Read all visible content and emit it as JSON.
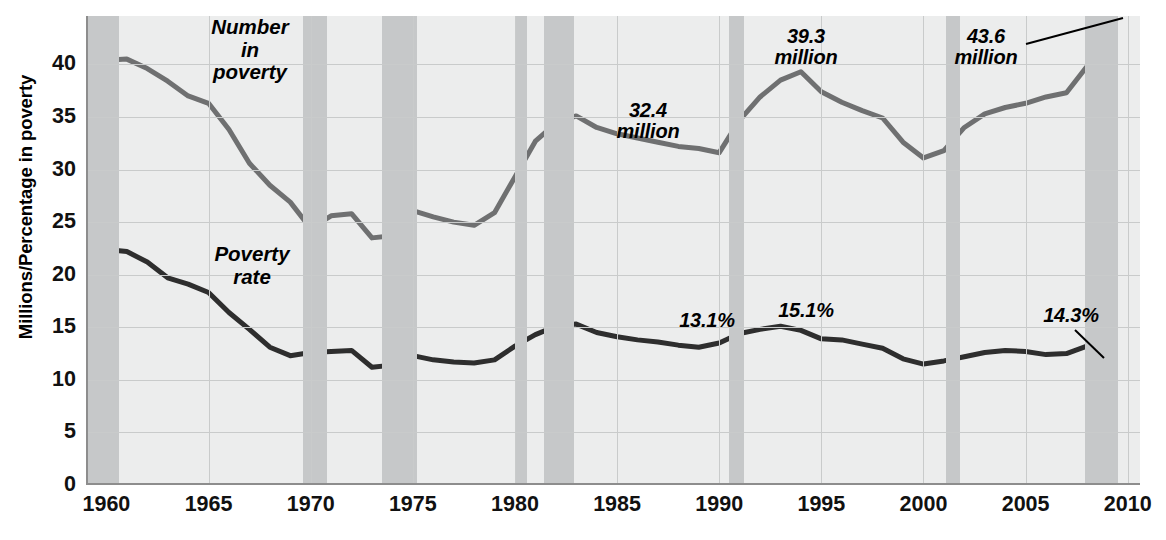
{
  "axes": {
    "ylabel": "Millions/Percentage in poverty",
    "yticks": [
      0,
      5,
      10,
      15,
      20,
      25,
      30,
      35,
      40
    ],
    "ylim": [
      0,
      44.6
    ],
    "xticks": [
      1960,
      1965,
      1970,
      1975,
      1980,
      1985,
      1990,
      1995,
      2000,
      2005,
      2010
    ],
    "xlim": [
      1959,
      2010.6
    ]
  },
  "series_labels": {
    "number": "Number\nin\npoverty",
    "number_l1": "Number",
    "number_l2": "in",
    "number_l3": "poverty",
    "rate_l1": "Poverty",
    "rate_l2": "rate"
  },
  "annotations": [
    {
      "id": "a1",
      "line1": "32.4",
      "line2": "million",
      "x": 648,
      "y": 100,
      "leader": false
    },
    {
      "id": "a2",
      "line1": "39.3",
      "line2": "million",
      "x": 806,
      "y": 26,
      "leader": false
    },
    {
      "id": "a3",
      "line1": "43.6",
      "line2": "million",
      "x": 986,
      "y": 26,
      "leader": true
    },
    {
      "id": "a4",
      "line1": "13.1%",
      "line2": "",
      "x": 707,
      "y": 310,
      "leader": false
    },
    {
      "id": "a5",
      "line1": "15.1%",
      "line2": "",
      "x": 806,
      "y": 300,
      "leader": false
    },
    {
      "id": "a6",
      "line1": "14.3%",
      "line2": "",
      "x": 1071,
      "y": 305,
      "leader": true
    }
  ],
  "colors": {
    "plot_bg": "#eceded",
    "recession_band": "#c6c8c9",
    "grid": "#c9cbcb",
    "axis": "#8d8d8d",
    "number_line": "#6f7071",
    "rate_line": "#2e2e2e",
    "text": "#000000"
  },
  "recessions": [
    {
      "start": 1959.0,
      "end": 1960.6
    },
    {
      "start": 1969.6,
      "end": 1970.8
    },
    {
      "start": 1973.5,
      "end": 1975.2
    },
    {
      "start": 1980.0,
      "end": 1980.6
    },
    {
      "start": 1981.4,
      "end": 1982.9
    },
    {
      "start": 1990.5,
      "end": 1991.2
    },
    {
      "start": 2001.1,
      "end": 2001.8
    },
    {
      "start": 2007.9,
      "end": 2009.5
    }
  ],
  "chart_data": {
    "type": "line",
    "title": "",
    "xlabel": "",
    "ylabel": "Millions/Percentage in poverty",
    "xlim": [
      1959,
      2010.6
    ],
    "ylim": [
      0,
      44.6
    ],
    "grid": true,
    "legend": "inline-labels",
    "x": [
      1959,
      1960,
      1961,
      1962,
      1963,
      1964,
      1965,
      1966,
      1967,
      1968,
      1969,
      1970,
      1971,
      1972,
      1973,
      1974,
      1975,
      1976,
      1977,
      1978,
      1979,
      1980,
      1981,
      1982,
      1983,
      1984,
      1985,
      1986,
      1987,
      1988,
      1989,
      1990,
      1991,
      1992,
      1993,
      1994,
      1995,
      1996,
      1997,
      1998,
      1999,
      2000,
      2001,
      2002,
      2003,
      2004,
      2005,
      2006,
      2007,
      2008,
      2009
    ],
    "series": [
      {
        "name": "Number in poverty",
        "unit": "millions",
        "color": "#6f7071",
        "values": [
          39.9,
          40.4,
          40.5,
          39.6,
          38.4,
          37.0,
          36.3,
          33.8,
          30.6,
          28.5,
          26.9,
          24.4,
          25.6,
          25.8,
          23.5,
          23.7,
          26.1,
          25.5,
          25.0,
          24.7,
          25.9,
          29.3,
          32.7,
          34.4,
          35.1,
          34.0,
          33.4,
          33.0,
          32.6,
          32.2,
          32.0,
          31.6,
          34.7,
          36.9,
          38.5,
          39.3,
          37.4,
          36.4,
          35.6,
          34.9,
          32.6,
          31.1,
          31.8,
          34.0,
          35.3,
          35.9,
          36.3,
          36.9,
          37.3,
          39.8,
          43.6
        ]
      },
      {
        "name": "Poverty rate",
        "unit": "percent",
        "color": "#2e2e2e",
        "values": [
          22.6,
          22.4,
          22.2,
          21.2,
          19.7,
          19.1,
          18.3,
          16.4,
          14.8,
          13.1,
          12.3,
          12.6,
          12.7,
          12.8,
          11.2,
          11.4,
          12.3,
          11.9,
          11.7,
          11.6,
          11.9,
          13.2,
          14.3,
          15.1,
          15.3,
          14.5,
          14.1,
          13.8,
          13.6,
          13.3,
          13.1,
          13.5,
          14.4,
          14.8,
          15.1,
          14.7,
          13.9,
          13.8,
          13.4,
          13.0,
          12.0,
          11.5,
          11.8,
          12.2,
          12.6,
          12.8,
          12.7,
          12.4,
          12.5,
          13.2,
          14.3
        ]
      }
    ],
    "callouts": [
      {
        "label": "32.4 million",
        "series": "Number in poverty",
        "value": 32.4
      },
      {
        "label": "39.3 million",
        "series": "Number in poverty",
        "value": 39.3,
        "x": 1994
      },
      {
        "label": "43.6 million",
        "series": "Number in poverty",
        "value": 43.6,
        "x": 2009
      },
      {
        "label": "13.1%",
        "series": "Poverty rate",
        "value": 13.1,
        "x": 1989
      },
      {
        "label": "15.1%",
        "series": "Poverty rate",
        "value": 15.1,
        "x": 1993
      },
      {
        "label": "14.3%",
        "series": "Poverty rate",
        "value": 14.3,
        "x": 2009
      }
    ]
  }
}
